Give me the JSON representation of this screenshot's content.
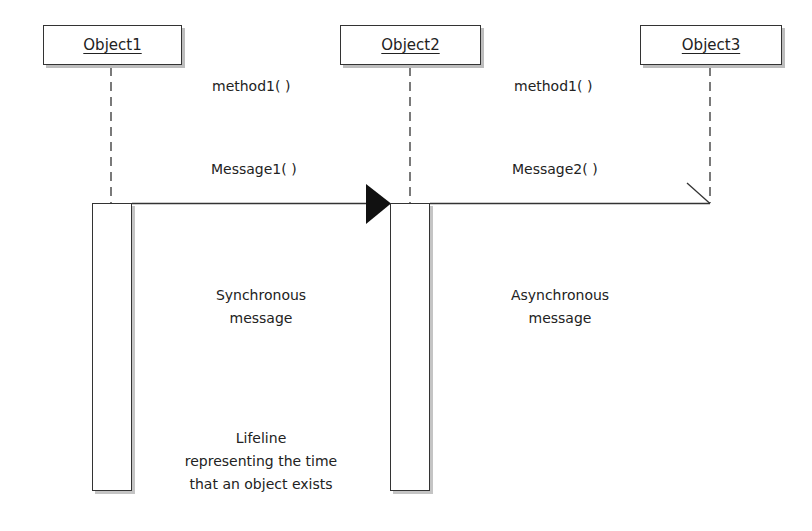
{
  "diagram": {
    "type": "UML sequence diagram",
    "objects": [
      {
        "name": "Object1",
        "label": "Object1"
      },
      {
        "name": "Object2",
        "label": "Object2"
      },
      {
        "name": "Object3",
        "label": "Object3"
      }
    ],
    "method_labels": [
      {
        "between": [
          "Object1",
          "Object2"
        ],
        "text": "method1( )"
      },
      {
        "between": [
          "Object2",
          "Object3"
        ],
        "text": "method1( )"
      }
    ],
    "messages": [
      {
        "from": "Object1",
        "to": "Object2",
        "text": "Message1( )",
        "kind": "synchronous",
        "arrowhead": "filled-triangle"
      },
      {
        "from": "Object2",
        "to": "Object3",
        "text": "Message2( )",
        "kind": "asynchronous",
        "arrowhead": "open-half"
      }
    ],
    "annotations": {
      "synchronous": [
        "Synchronous",
        "message"
      ],
      "asynchronous": [
        "Asynchronous",
        "message"
      ],
      "lifeline": [
        "Lifeline",
        "representing the time",
        "that an object exists"
      ]
    },
    "colors": {
      "line": "#333333",
      "shadow": "#bdbdbd",
      "background": "#ffffff",
      "text": "#222222"
    }
  }
}
